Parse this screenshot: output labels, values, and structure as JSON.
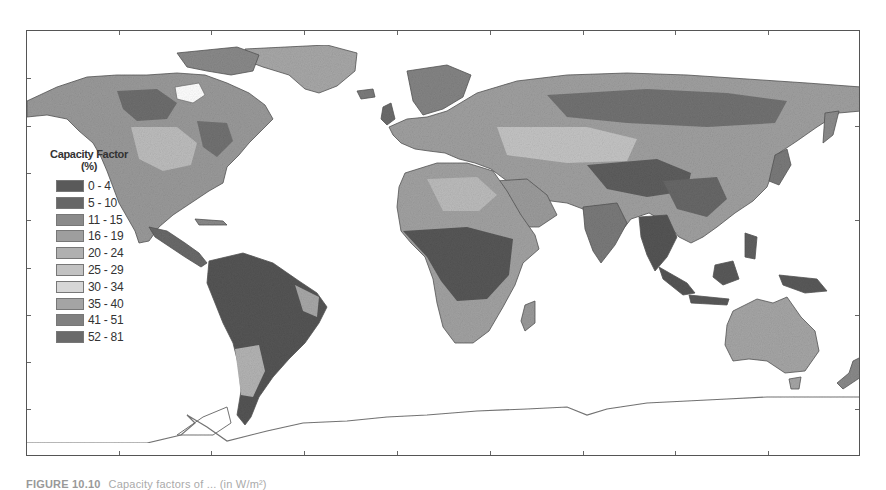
{
  "map": {
    "title": "World wind capacity factor map",
    "legend": {
      "title_line1": "Capacity Factor",
      "title_line2": "(%)",
      "items": [
        {
          "label": "0 - 4",
          "color": "#5a5a5a"
        },
        {
          "label": "5 - 10",
          "color": "#666666"
        },
        {
          "label": "11 - 15",
          "color": "#8a8a8a"
        },
        {
          "label": "16 - 19",
          "color": "#9e9e9e"
        },
        {
          "label": "20 - 24",
          "color": "#b0b0b0"
        },
        {
          "label": "25 - 29",
          "color": "#c2c2c2"
        },
        {
          "label": "30 - 34",
          "color": "#d6d6d6"
        },
        {
          "label": "35 - 40",
          "color": "#a4a4a4"
        },
        {
          "label": "41 - 51",
          "color": "#808080"
        },
        {
          "label": "52 - 81",
          "color": "#6a6a6a"
        }
      ]
    },
    "regions": {
      "north_america": "mixed 11-29",
      "south_america": "mostly 0-10",
      "africa_north": "16-34",
      "africa_central": "0-10",
      "europe_asia": "mixed 11-51",
      "southeast_asia": "0-10",
      "australia": "20-34",
      "antarctica": "outline only"
    }
  },
  "caption": {
    "figure_label": "FIGURE 10.10",
    "text": "Capacity factors of ... (in W/m²)"
  }
}
